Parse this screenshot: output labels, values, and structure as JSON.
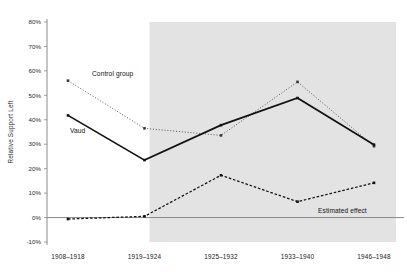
{
  "chart_data": {
    "type": "line",
    "title": "",
    "xlabel": "",
    "ylabel": "Relative Support Left",
    "categories": [
      "1908–1918",
      "1919–1924",
      "1925–1932",
      "1933–1940",
      "1946–1948"
    ],
    "ylim": [
      -10,
      80
    ],
    "yticks": [
      -10,
      0,
      10,
      20,
      30,
      40,
      50,
      60,
      70,
      80
    ],
    "ytick_labels": [
      "-10%",
      "0%",
      "10%",
      "20%",
      "30%",
      "40%",
      "50%",
      "60%",
      "70%",
      "80%"
    ],
    "grid": false,
    "legend": "inline-annotations",
    "zero_line": true,
    "shaded_region": {
      "label": "",
      "from_category_index": 1,
      "to_category_index": 4,
      "color": "#e3e3e3"
    },
    "series": [
      {
        "name": "Control group",
        "values": [
          56.0,
          36.5,
          33.6,
          55.5,
          29.2
        ],
        "style": "dotted",
        "color": "#3a3a3a",
        "marker": "square",
        "annotation": "Control group"
      },
      {
        "name": "Vaud",
        "values": [
          41.8,
          23.5,
          37.8,
          48.9,
          29.8
        ],
        "style": "solid",
        "color": "#111111",
        "marker": "square",
        "annotation": "Vaud"
      },
      {
        "name": "Estimated effect",
        "values": [
          -0.6,
          0.5,
          17.3,
          6.5,
          14.2
        ],
        "style": "dashed",
        "color": "#111111",
        "marker": "square",
        "annotation": "Estimated effect"
      }
    ]
  },
  "annotations": {
    "control_group": "Control group",
    "vaud": "Vaud",
    "estimated_effect": "Estimated effect"
  }
}
